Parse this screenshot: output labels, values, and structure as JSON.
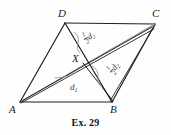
{
  "figure": {
    "caption": "Ex. 29",
    "shape": "parallelogram",
    "stroke_color": "#1f1f1f",
    "accent_color": "#8a8a8a",
    "background": "#fefefe",
    "vertices": [
      {
        "name": "D",
        "label": "D",
        "x": 65,
        "y": 23
      },
      {
        "name": "C",
        "label": "C",
        "x": 155,
        "y": 24
      },
      {
        "name": "B",
        "label": "B",
        "x": 112,
        "y": 102
      },
      {
        "name": "A",
        "label": "A",
        "x": 20,
        "y": 102
      },
      {
        "name": "X",
        "label": "X",
        "x": 83,
        "y": 63
      }
    ],
    "vertex_label_positions": [
      {
        "name": "D",
        "left": 58,
        "top": 8
      },
      {
        "name": "C",
        "left": 152,
        "top": 8
      },
      {
        "name": "B",
        "left": 110,
        "top": 104
      },
      {
        "name": "A",
        "left": 9,
        "top": 104
      },
      {
        "name": "X",
        "left": 72,
        "top": 53
      }
    ],
    "segment_labels": [
      {
        "name": "half-d2-upper",
        "numerator": "1",
        "denominator": "2",
        "symbol": "d",
        "subscript": "2",
        "left": 84,
        "top": 32,
        "rotation": "rot-d2a"
      },
      {
        "name": "half-d2-lower",
        "numerator": "1",
        "denominator": "2",
        "symbol": "d",
        "subscript": "2",
        "left": 110,
        "top": 65,
        "rotation": "rot-d2b"
      }
    ],
    "diagonal_labels": [
      {
        "name": "d1",
        "symbol": "d",
        "subscript": "1",
        "left": 70,
        "top": 83
      }
    ]
  }
}
